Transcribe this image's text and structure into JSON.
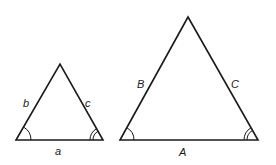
{
  "diagram": {
    "small_triangle": {
      "vertices": {
        "left": [
          16,
          140
        ],
        "apex": [
          60,
          64
        ],
        "right": [
          103,
          140
        ]
      },
      "labels": {
        "bottom": "a",
        "left_side": "b",
        "right_side": "c"
      },
      "angle_marks": {
        "left": "single-arc",
        "right": "double-arc"
      }
    },
    "large_triangle": {
      "vertices": {
        "left": [
          120,
          140
        ],
        "apex": [
          188,
          17
        ],
        "right": [
          258,
          140
        ]
      },
      "labels": {
        "bottom": "A",
        "left_side": "B",
        "right_side": "C"
      },
      "angle_marks": {
        "left": "single-arc",
        "right": "double-arc"
      }
    },
    "colors": {
      "stroke": "#1a1a1a",
      "background": "#ffffff"
    }
  }
}
